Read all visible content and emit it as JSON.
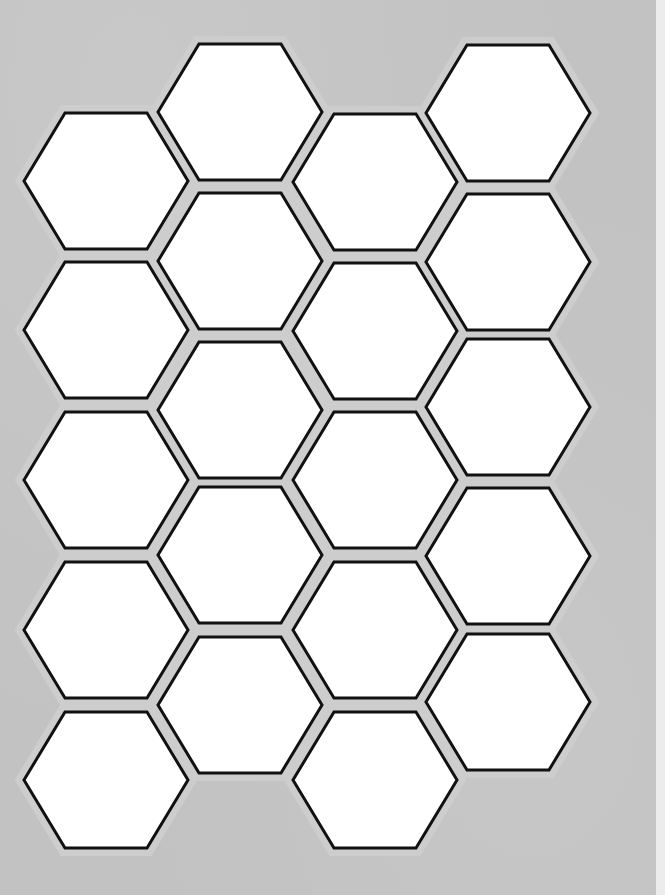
{
  "sheet": {
    "background_color": "#c2c2c2",
    "gap_color": "#cdcdcd",
    "hex_fill": "#ffffff",
    "hex_stroke": "#111111",
    "right_strip_color": "#ececec",
    "hex_width": 164,
    "hex_height": 136
  },
  "columns": [
    {
      "cx": 106,
      "centers_y": [
        181,
        330,
        480,
        630,
        780
      ]
    },
    {
      "cx": 240,
      "centers_y": [
        112,
        261,
        410,
        555,
        705
      ]
    },
    {
      "cx": 375,
      "centers_y": [
        182,
        331,
        480,
        630,
        780
      ]
    },
    {
      "cx": 508,
      "centers_y": [
        113,
        262,
        407,
        556,
        702
      ]
    }
  ]
}
